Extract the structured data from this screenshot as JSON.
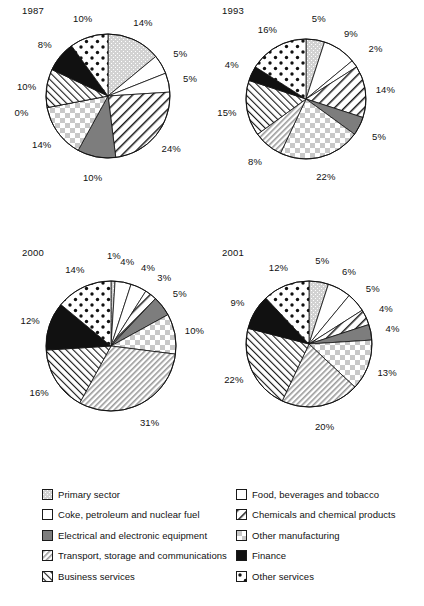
{
  "figure": {
    "caption": ""
  },
  "palette": {
    "primary_sector": "#cfcfcf",
    "food_bev": "#ffffff",
    "coke_fuel": "#ffffff",
    "chemicals": "#ffffff",
    "electrical": "#808080",
    "other_manufacturing": "#d9d9d9",
    "transport": "#d9d9d9",
    "finance": "#111111",
    "business_services": "#ffffff",
    "other_services": "#ffffff",
    "outline": "#111111"
  },
  "legend": {
    "rows": [
      {
        "left": {
          "key": "primary_sector",
          "label": "Primary sector",
          "pattern": "dotgray"
        },
        "right": {
          "key": "food_bev",
          "label": "Food, beverages and tobacco",
          "pattern": "plain"
        }
      },
      {
        "left": {
          "key": "coke_fuel",
          "label": "Coke, petroleum and nuclear fuel",
          "pattern": "plain"
        },
        "right": {
          "key": "chemicals",
          "label": "Chemicals and chemical products",
          "pattern": "diaghatch"
        }
      },
      {
        "left": {
          "key": "electrical",
          "label": "Electrical and electronic equipment",
          "pattern": "solidgray"
        },
        "right": {
          "key": "other_manufacturing",
          "label": "Other manufacturing",
          "pattern": "checker"
        }
      },
      {
        "left": {
          "key": "transport",
          "label": "Transport, storage and communications",
          "pattern": "finediag"
        },
        "right": {
          "key": "finance",
          "label": "Finance",
          "pattern": "solidblack"
        }
      },
      {
        "left": {
          "key": "business_services",
          "label": "Business services",
          "pattern": "thindiag"
        },
        "right": {
          "key": "other_services",
          "label": "Other services",
          "pattern": "dots"
        }
      }
    ]
  },
  "chart_data": [
    {
      "type": "pie",
      "title": "1987",
      "categories": [
        "Primary sector",
        "Food, beverages and tobacco",
        "Coke, petroleum and nuclear fuel",
        "Chemicals and chemical products",
        "Electrical and electronic equipment",
        "Other manufacturing",
        "Transport, storage and communications",
        "Business services",
        "Finance",
        "Other services"
      ],
      "values": [
        14,
        5,
        5,
        24,
        10,
        14,
        0,
        10,
        8,
        10
      ],
      "labels": [
        "14%",
        "5%",
        "5%",
        "24%",
        "10%",
        "14%",
        "0%",
        "10%",
        "8%",
        "10%"
      ],
      "legend": "shared-below",
      "grid": false
    },
    {
      "type": "pie",
      "title": "1993",
      "categories": [
        "Primary sector",
        "Food, beverages and tobacco",
        "Coke, petroleum and nuclear fuel",
        "Chemicals and chemical products",
        "Electrical and electronic equipment",
        "Other manufacturing",
        "Transport, storage and communications",
        "Business services",
        "Finance",
        "Other services"
      ],
      "values": [
        5,
        9,
        2,
        14,
        5,
        22,
        8,
        15,
        4,
        16
      ],
      "labels": [
        "5%",
        "9%",
        "2%",
        "14%",
        "5%",
        "22%",
        "8%",
        "15%",
        "4%",
        "16%"
      ],
      "legend": "shared-below",
      "grid": false
    },
    {
      "type": "pie",
      "title": "2000",
      "categories": [
        "Primary sector",
        "Food, beverages and tobacco",
        "Coke, petroleum and nuclear fuel",
        "Chemicals and chemical products",
        "Electrical and electronic equipment",
        "Other manufacturing",
        "Transport, storage and communications",
        "Business services",
        "Finance",
        "Other services"
      ],
      "values": [
        1,
        4,
        4,
        3,
        5,
        10,
        31,
        16,
        12,
        14
      ],
      "labels": [
        "1%",
        "4%",
        "4%",
        "3%",
        "5%",
        "10%",
        "31%",
        "16%",
        "12%",
        "14%"
      ],
      "legend": "shared-below",
      "grid": false
    },
    {
      "type": "pie",
      "title": "2001",
      "categories": [
        "Primary sector",
        "Food, beverages and tobacco",
        "Coke, petroleum and nuclear fuel",
        "Chemicals and chemical products",
        "Electrical and electronic equipment",
        "Other manufacturing",
        "Transport, storage and communications",
        "Business services",
        "Finance",
        "Other services"
      ],
      "values": [
        5,
        6,
        5,
        4,
        4,
        13,
        20,
        22,
        9,
        12
      ],
      "labels": [
        "5%",
        "6%",
        "5%",
        "4%",
        "4%",
        "13%",
        "20%",
        "22%",
        "9%",
        "12%"
      ],
      "legend": "shared-below",
      "grid": false
    }
  ]
}
